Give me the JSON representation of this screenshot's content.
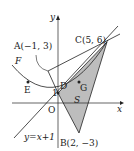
{
  "labels": {
    "y_axis": "y",
    "x_axis": "x",
    "origin": "O",
    "point_A": "A(−1, 3)",
    "point_C": "C(5, 6)",
    "point_B": "B(2, −3)",
    "point_D": "D",
    "point_E": "E",
    "point_G": "G",
    "point_1": "1",
    "curve_F": "F",
    "region_S": "S",
    "line_eq": "y=x+1"
  },
  "colors": {
    "shade": "#bdbdbd",
    "line": "#222222"
  }
}
